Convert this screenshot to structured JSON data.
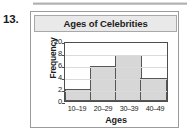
{
  "question_number": "13.",
  "chart_data": {
    "type": "bar",
    "title": "Ages of Celebrities",
    "xlabel": "Ages",
    "ylabel": "Frequency",
    "categories": [
      "10–19",
      "20–29",
      "30–39",
      "40–49"
    ],
    "values": [
      2,
      6,
      8,
      4
    ],
    "ylim": [
      0,
      10
    ],
    "yticks": [
      0,
      2,
      4,
      6,
      8,
      10
    ],
    "ytick_labels": [
      "0",
      "2",
      "4",
      "6",
      "8",
      "10"
    ],
    "grid": true,
    "legend": false,
    "bar_fill_color": "#d7d7d7",
    "bar_border_color": "#565656",
    "title_band_color": "#e9e9e9",
    "frame_color": "#9b9b9b"
  }
}
